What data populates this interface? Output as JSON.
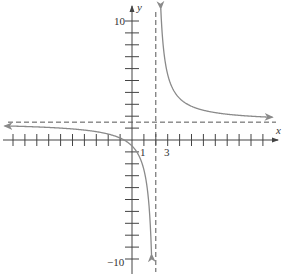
{
  "chart_data": {
    "type": "line",
    "title": "",
    "xlabel": "x",
    "ylabel": "y",
    "function": "y = 1.5 + 4/(x - 2)",
    "vertical_asymptote": {
      "x": 2,
      "style": "dashed"
    },
    "horizontal_asymptote": {
      "y": 1.5,
      "style": "dashed"
    },
    "xlim": [
      -11,
      12
    ],
    "ylim": [
      -10.5,
      11.5
    ],
    "x_tick_step": 1,
    "y_tick_step": 1,
    "x_tick_labels": [
      {
        "value": 1,
        "label": "1"
      },
      {
        "value": 3,
        "label": "3"
      }
    ],
    "y_tick_labels": [
      {
        "value": 10,
        "label": "10"
      },
      {
        "value": -10,
        "label": "−10"
      }
    ],
    "series": [
      {
        "name": "left branch",
        "x_range": [
          -11,
          1.7
        ],
        "arrows": "both ends"
      },
      {
        "name": "right branch",
        "x_range": [
          2.25,
          11.5
        ],
        "arrows": "both ends"
      }
    ],
    "grid": false,
    "legend": null
  },
  "colors": {
    "axes": "#444444",
    "curve": "#8a8a8a",
    "asymptote": "#555555",
    "background": "#ffffff"
  },
  "labels": {
    "x_axis": "x",
    "y_axis": "y",
    "tick_1": "1",
    "tick_3": "3",
    "tick_10": "10",
    "tick_neg10": "−10"
  }
}
